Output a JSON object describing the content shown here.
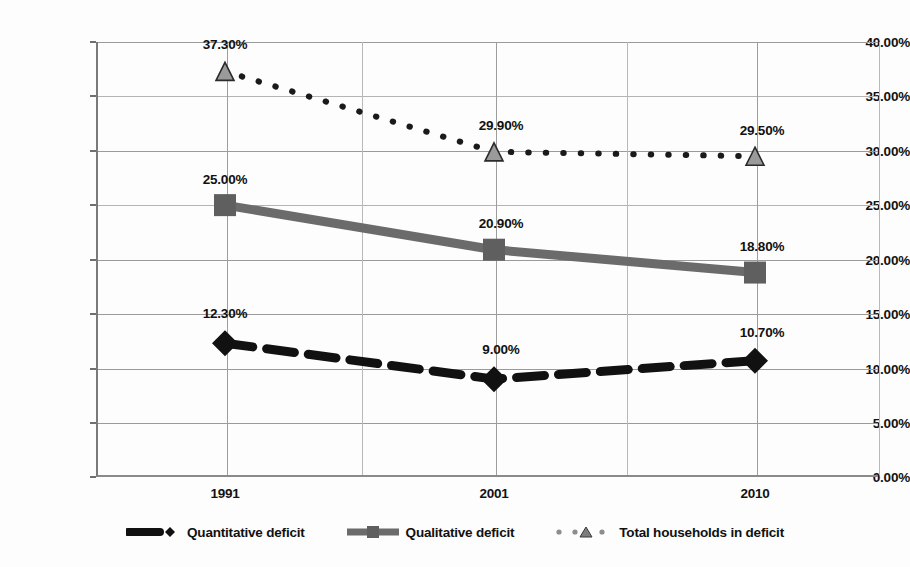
{
  "chart_data": {
    "type": "line",
    "title": "",
    "subtitle": "",
    "xlabel": "",
    "ylabel": "",
    "categories": [
      "1991",
      "2001",
      "2010"
    ],
    "x": [
      1991,
      2001,
      2010
    ],
    "ylim": [
      0,
      40
    ],
    "ytick_labels": [
      "0.00%",
      "5.00%",
      "10.00%",
      "15.00%",
      "20.00%",
      "25.00%",
      "30.00%",
      "35.00%",
      "40.00%"
    ],
    "ytick_values": [
      0,
      5,
      10,
      15,
      20,
      25,
      30,
      35,
      40
    ],
    "grid": true,
    "legend_position": "bottom",
    "series": [
      {
        "name": "Quantitative deficit",
        "values": [
          12.3,
          9.0,
          10.7
        ],
        "labels": [
          "12.30%",
          "9.00%",
          "10.70%"
        ],
        "color": "#111111",
        "style": "thick-dashed",
        "marker": "diamond"
      },
      {
        "name": "Qualitative deficit",
        "values": [
          25.0,
          20.9,
          18.8
        ],
        "labels": [
          "25.00%",
          "20.90%",
          "18.80%"
        ],
        "color": "#6b6b6b",
        "style": "thick-solid",
        "marker": "square"
      },
      {
        "name": "Total households in deficit",
        "values": [
          37.3,
          29.9,
          29.5
        ],
        "labels": [
          "37.30%",
          "29.90%",
          "29.50%"
        ],
        "color": "#1a1a1a",
        "style": "dotted",
        "marker": "triangle"
      }
    ]
  },
  "axis": {
    "y_labels": [
      {
        "text": "40.00%",
        "value": 40
      },
      {
        "text": "35.00%",
        "value": 35
      },
      {
        "text": "30.00%",
        "value": 30
      },
      {
        "text": "25.00%",
        "value": 25
      },
      {
        "text": "20.00%",
        "value": 20
      },
      {
        "text": "15.00%",
        "value": 15
      },
      {
        "text": "10.00%",
        "value": 10
      },
      {
        "text": "5.00%",
        "value": 5
      },
      {
        "text": "0.00%",
        "value": 0
      }
    ],
    "x_labels": [
      {
        "text": "1991"
      },
      {
        "text": "2001"
      },
      {
        "text": "2010"
      }
    ]
  },
  "data_labels": [
    {
      "text": "37.30%"
    },
    {
      "text": "29.90%"
    },
    {
      "text": "29.50%"
    },
    {
      "text": "25.00%"
    },
    {
      "text": "20.90%"
    },
    {
      "text": "18.80%"
    },
    {
      "text": "12.30%"
    },
    {
      "text": "9.00%"
    },
    {
      "text": "10.70%"
    }
  ],
  "legend": {
    "items": [
      {
        "label": "Quantitative deficit",
        "marker": "diamond-icon",
        "color": "#111111"
      },
      {
        "label": "Qualitative deficit",
        "marker": "square-icon",
        "color": "#6b6b6b"
      },
      {
        "label": "Total households in deficit",
        "marker": "triangle-icon",
        "color": "#8a8a8a"
      }
    ]
  }
}
